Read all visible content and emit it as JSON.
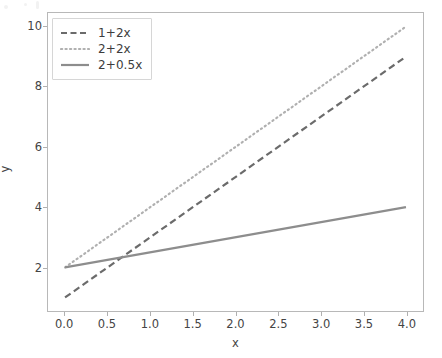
{
  "chart_data": {
    "type": "line",
    "title": "",
    "xlabel": "x",
    "ylabel": "y",
    "xlim": [
      -0.2,
      4.2
    ],
    "ylim": [
      0.55,
      10.45
    ],
    "grid": false,
    "legend_position": "upper left",
    "xticks": [
      "0.0",
      "0.5",
      "1.0",
      "1.5",
      "2.0",
      "2.5",
      "3.0",
      "3.5",
      "4.0"
    ],
    "xtick_values": [
      0.0,
      0.5,
      1.0,
      1.5,
      2.0,
      2.5,
      3.0,
      3.5,
      4.0
    ],
    "yticks": [
      "2",
      "4",
      "6",
      "8",
      "10"
    ],
    "ytick_values": [
      2,
      4,
      6,
      8,
      10
    ],
    "x": [
      0,
      4
    ],
    "series": [
      {
        "name": "1+2x",
        "values": [
          1,
          9
        ],
        "linestyle": "dashed",
        "color": "#6b6b6b",
        "linewidth": 2.2
      },
      {
        "name": "2+2x",
        "values": [
          2,
          10
        ],
        "linestyle": "dotted",
        "color": "#b0b0b0",
        "linewidth": 2.2
      },
      {
        "name": "2+0.5x",
        "values": [
          2,
          4
        ],
        "linestyle": "solid",
        "color": "#8d8d8d",
        "linewidth": 2.2
      }
    ]
  },
  "figure": {
    "background_color": "#ffffff",
    "axes_background_color": "#ffffff",
    "spine_color": "#b8b8b8",
    "tick_color": "#b0b0b0",
    "text_color": "#444444"
  }
}
